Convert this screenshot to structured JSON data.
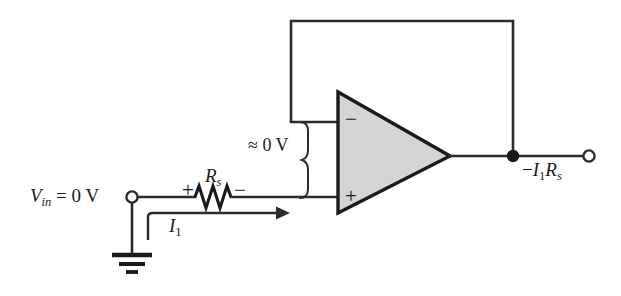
{
  "labels": {
    "input_source": "V",
    "input_source_sub": "in",
    "input_source_value": " = 0 V",
    "resistor_name": "R",
    "resistor_sub": "s",
    "resistor_polarity_plus": "+",
    "resistor_polarity_minus": "−",
    "current_name": "I",
    "current_sub": "1",
    "virtual_ground": "≈ 0 V",
    "opamp_inverting": "−",
    "opamp_noninverting": "+",
    "output_sign": "−",
    "output_current": "I",
    "output_current_sub": "1",
    "output_resistor": "R",
    "output_resistor_sub": "s"
  },
  "nodes": {
    "input_terminal": {
      "x": 132,
      "y": 197,
      "type": "open-terminal"
    },
    "output_junction": {
      "x": 513,
      "y": 156,
      "type": "filled-node"
    },
    "output_terminal": {
      "x": 589,
      "y": 156,
      "type": "open-terminal"
    },
    "ground": {
      "x": 132,
      "y": 255,
      "type": "earth-ground"
    }
  },
  "opamp": {
    "apex_x": 450,
    "apex_y": 156,
    "left_x": 338,
    "top_y": 92,
    "bottom_y": 213,
    "fill_color": "#d4d4d4",
    "stroke_color": "#1a1a1a",
    "inverting_input_y": 122,
    "noninverting_input_y": 198
  },
  "wires": {
    "line_color": "#2b2b2b",
    "feedback_top_y": 21,
    "feedback_left_x": 291,
    "feedback_right_x": 513,
    "signal_y": 197,
    "resistor_start_x": 195,
    "resistor_end_x": 231,
    "current_arrow_y": 213,
    "current_arrow_tip_x": 283,
    "brace_x": 307
  },
  "colors": {
    "background": "#ffffff",
    "ink": "#1a1a1a",
    "wire": "#2b2b2b",
    "opamp_fill": "#d4d4d4"
  }
}
